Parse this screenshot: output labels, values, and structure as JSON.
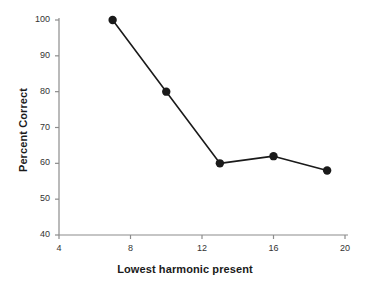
{
  "chart_data": {
    "type": "line",
    "title": "",
    "xlabel": "Lowest harmonic present",
    "ylabel": "Percent Correct",
    "x": [
      7,
      10,
      13,
      16,
      19
    ],
    "values": [
      100,
      80,
      60,
      62,
      58
    ],
    "series": [
      {
        "name": "Percent Correct",
        "x": [
          7,
          10,
          13,
          16,
          19
        ],
        "values": [
          100,
          80,
          60,
          62,
          58
        ],
        "color": "#1a1a1a",
        "marker": "filled-circle"
      }
    ],
    "xlim": [
      4,
      20
    ],
    "ylim": [
      40,
      100
    ],
    "xticks": [
      4,
      8,
      12,
      16,
      20
    ],
    "yticks": [
      40,
      50,
      60,
      70,
      80,
      90,
      100
    ],
    "xtick_labels": [
      "4",
      "8",
      "12",
      "16",
      "20"
    ],
    "ytick_labels": [
      "40",
      "50",
      "60",
      "70",
      "80",
      "90",
      "100"
    ],
    "grid": false,
    "legend": null,
    "legend_position": "none",
    "annotations": [],
    "axis_color": "#8c8c8c",
    "line_color": "#1a1a1a",
    "marker_color": "#1a1a1a",
    "background": "#ffffff"
  }
}
